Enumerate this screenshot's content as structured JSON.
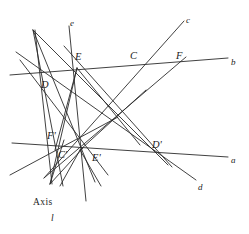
{
  "figure": {
    "kind": "geometric-diagram",
    "background_color": "#ffffff",
    "line_color": "#2b2b2b",
    "text_color": "#1c1c1c",
    "width": 249,
    "height": 234,
    "axis_caption": "Axis",
    "axis_line_label": "l"
  },
  "point_labels": [
    {
      "id": "D",
      "text": "D",
      "x": 41,
      "y": 80,
      "point_x": 48,
      "point_y": 75
    },
    {
      "id": "E",
      "text": "E",
      "x": 75,
      "y": 52,
      "point_x": 77,
      "point_y": 68
    },
    {
      "id": "C",
      "text": "C",
      "x": 130,
      "y": 51,
      "point_x": 135,
      "point_y": 64
    },
    {
      "id": "F",
      "text": "F",
      "x": 176,
      "y": 51,
      "point_x": 180,
      "point_y": 62
    },
    {
      "id": "Fp",
      "text": "F'",
      "x": 47,
      "y": 131,
      "point_x": 57,
      "point_y": 142
    },
    {
      "id": "Cp",
      "text": "C'",
      "x": 58,
      "y": 150,
      "point_x": 66,
      "point_y": 148
    },
    {
      "id": "Ep",
      "text": "E'",
      "x": 92,
      "y": 153,
      "point_x": 80,
      "point_y": 150
    },
    {
      "id": "Dp",
      "text": "D'",
      "x": 152,
      "y": 140,
      "point_x": 155,
      "point_y": 150
    }
  ],
  "line_labels": [
    {
      "id": "a",
      "text": "a",
      "x": 231,
      "y": 156
    },
    {
      "id": "b",
      "text": "b",
      "x": 231,
      "y": 58
    },
    {
      "id": "c",
      "text": "c",
      "x": 186,
      "y": 16
    },
    {
      "id": "d",
      "text": "d",
      "x": 198,
      "y": 183
    },
    {
      "id": "e",
      "text": "e",
      "x": 70,
      "y": 19
    }
  ],
  "lines": [
    {
      "id": "line-b",
      "name": "line-b",
      "x1": 10,
      "y1": 75,
      "x2": 228,
      "y2": 58
    },
    {
      "id": "line-a",
      "name": "line-a",
      "x1": 12,
      "y1": 143,
      "x2": 228,
      "y2": 157
    },
    {
      "id": "line-c",
      "name": "line-c",
      "x1": 44,
      "y1": 178,
      "x2": 184,
      "y2": 21
    },
    {
      "id": "line-d",
      "name": "line-d",
      "x1": 16,
      "y1": 52,
      "x2": 196,
      "y2": 180
    },
    {
      "id": "line-e",
      "name": "line-e",
      "x1": 69,
      "y1": 26,
      "x2": 86,
      "y2": 201
    },
    {
      "id": "line-axis",
      "name": "axis-line-l",
      "x1": 35,
      "y1": 30,
      "x2": 52,
      "y2": 184
    },
    {
      "id": "line-EC-Dp",
      "name": "line-through-E-C-Dp",
      "x1": 33,
      "y1": 30,
      "x2": 168,
      "y2": 165
    },
    {
      "id": "line-E-Cp",
      "name": "line-E-to-Cp",
      "x1": 33,
      "y1": 30,
      "x2": 95,
      "y2": 182
    },
    {
      "id": "line-D-Ep",
      "name": "line-D-to-Ep",
      "x1": 33,
      "y1": 30,
      "x2": 63,
      "y2": 186
    },
    {
      "id": "line-F-Ep",
      "name": "line-F-through-Ep",
      "x1": 186,
      "y1": 57,
      "x2": 44,
      "y2": 178
    },
    {
      "id": "line-E-Dp",
      "name": "line-E-to-Dp",
      "x1": 64,
      "y1": 46,
      "x2": 172,
      "y2": 167
    },
    {
      "id": "line-Fp-long",
      "name": "line-through-Fp",
      "x1": 10,
      "y1": 175,
      "x2": 118,
      "y2": 117
    },
    {
      "id": "line-D-down",
      "name": "line-D-descending",
      "x1": 20,
      "y1": 60,
      "x2": 108,
      "y2": 175
    },
    {
      "id": "line-axis-fan-1",
      "name": "axis-fan-line-1",
      "x1": 50,
      "y1": 184,
      "x2": 83,
      "y2": 148
    },
    {
      "id": "line-axis-fan-2",
      "name": "axis-fan-line-2",
      "x1": 50,
      "y1": 184,
      "x2": 64,
      "y2": 140
    },
    {
      "id": "line-axis-fan-3",
      "name": "axis-fan-line-3",
      "x1": 50,
      "y1": 184,
      "x2": 77,
      "y2": 68
    },
    {
      "id": "line-Ep-fan-1",
      "name": "Ep-fan-line-down-left",
      "x1": 80,
      "y1": 150,
      "x2": 60,
      "y2": 186
    },
    {
      "id": "line-Ep-fan-2",
      "name": "Ep-fan-line-down-right",
      "x1": 80,
      "y1": 150,
      "x2": 101,
      "y2": 186
    },
    {
      "id": "line-Ep-fan-3",
      "name": "Ep-fan-line-up-right",
      "x1": 80,
      "y1": 150,
      "x2": 146,
      "y2": 90
    },
    {
      "id": "line-E-fan-1",
      "name": "E-fan-line-down-right",
      "x1": 77,
      "y1": 68,
      "x2": 140,
      "y2": 145
    },
    {
      "id": "line-E-fan-2",
      "name": "E-fan-line-down-left",
      "x1": 77,
      "y1": 68,
      "x2": 55,
      "y2": 150
    }
  ]
}
